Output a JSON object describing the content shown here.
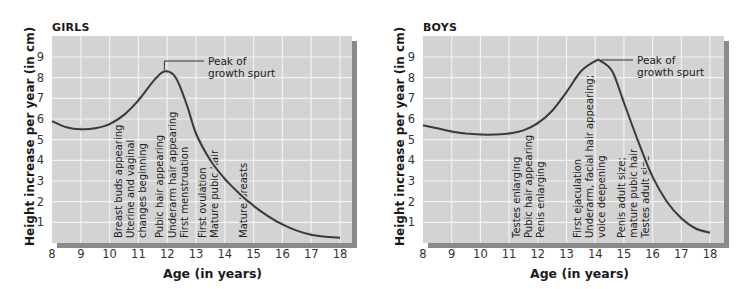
{
  "chart_data": [
    {
      "type": "line",
      "title": "GIRLS",
      "xlabel": "Age (in years)",
      "ylabel": "Height increase per year (in cm)",
      "xlim": [
        8,
        18
      ],
      "ylim": [
        0,
        9.9
      ],
      "x_ticks": [
        8,
        9,
        10,
        11,
        12,
        13,
        14,
        15,
        16,
        17,
        18
      ],
      "y_ticks": [
        1,
        2,
        3,
        4,
        5,
        6,
        7,
        8,
        9
      ],
      "grid": true,
      "series": [
        {
          "name": "Girls height increase",
          "x": [
            8,
            8.5,
            9,
            9.5,
            10,
            10.5,
            11,
            11.5,
            11.9,
            12.3,
            12.7,
            13,
            13.5,
            14,
            14.5,
            15,
            15.5,
            16,
            16.5,
            17,
            17.5,
            18
          ],
          "values": [
            5.9,
            5.6,
            5.5,
            5.55,
            5.75,
            6.2,
            6.9,
            7.8,
            8.3,
            8.0,
            6.6,
            5.3,
            4.0,
            3.1,
            2.4,
            1.8,
            1.3,
            0.9,
            0.6,
            0.4,
            0.3,
            0.25
          ]
        }
      ],
      "annotations": [
        {
          "text": "Peak of growth spurt",
          "x": 11.9,
          "y": 8.3
        },
        {
          "text": "Breast buds appearing",
          "x": 10.3
        },
        {
          "text": "Uterine and vaginal changes beginning",
          "x": 10.7
        },
        {
          "text": "Pubic hair appearing",
          "x": 11.6
        },
        {
          "text": "Underarm hair appearing",
          "x": 12.1
        },
        {
          "text": "First menstruation",
          "x": 12.5
        },
        {
          "text": "First ovulation",
          "x": 13.1
        },
        {
          "text": "Mature pubic hair",
          "x": 13.5
        },
        {
          "text": "Mature breasts",
          "x": 14.6
        }
      ]
    },
    {
      "type": "line",
      "title": "BOYS",
      "xlabel": "Age (in years)",
      "ylabel": "Height increase per year (in cm)",
      "xlim": [
        8,
        18
      ],
      "ylim": [
        0,
        9.9
      ],
      "x_ticks": [
        8,
        9,
        10,
        11,
        12,
        13,
        14,
        15,
        16,
        17,
        18
      ],
      "y_ticks": [
        1,
        2,
        3,
        4,
        5,
        6,
        7,
        8,
        9
      ],
      "grid": true,
      "series": [
        {
          "name": "Boys height increase",
          "x": [
            8,
            8.5,
            9,
            9.5,
            10,
            10.5,
            11,
            11.5,
            12,
            12.5,
            13,
            13.5,
            14,
            14.2,
            14.6,
            15,
            15.5,
            16,
            16.5,
            17,
            17.5,
            18
          ],
          "values": [
            5.7,
            5.55,
            5.4,
            5.3,
            5.25,
            5.25,
            5.3,
            5.45,
            5.8,
            6.4,
            7.3,
            8.3,
            8.8,
            8.8,
            8.3,
            6.8,
            4.9,
            3.2,
            2.0,
            1.2,
            0.7,
            0.5
          ]
        }
      ],
      "annotations": [
        {
          "text": "Peak of growth spurt",
          "x": 14.2,
          "y": 8.8
        },
        {
          "text": "Testes enlarging",
          "x": 11.3
        },
        {
          "text": "Pubic hair appearing",
          "x": 11.7
        },
        {
          "text": "Penis enlarging",
          "x": 12.1
        },
        {
          "text": "First ejaculation",
          "x": 13.2
        },
        {
          "text": "Underarm, facial hair appearing; voice deepening",
          "x": 13.6
        },
        {
          "text": "Penis adult size; mature pubic hair",
          "x": 14.8
        },
        {
          "text": "Testes adult size",
          "x": 15.6
        }
      ]
    }
  ],
  "girls": {
    "title": "GIRLS",
    "ylabel": "Height increase per year (in cm)",
    "xlabel": "Age (in years)",
    "peak_label_1": "Peak of",
    "peak_label_2": "growth spurt",
    "events": [
      "Breast buds appearing",
      "Uterine and vaginal",
      "changes beginning",
      "Pubic hair appearing",
      "Underarm hair appearing",
      "First menstruation",
      "First ovulation",
      "Mature pubic hair",
      "Mature breasts"
    ]
  },
  "boys": {
    "title": "BOYS",
    "ylabel": "Height increase per year (in cm)",
    "xlabel": "Age (in years)",
    "peak_label_1": "Peak of",
    "peak_label_2": "growth spurt",
    "events": [
      "Testes enlarging",
      "Pubic hair appearing",
      "Penis enlarging",
      "First ejaculation",
      "Underarm, facial hair appearing;",
      "voice deepening",
      "Penis adult size;",
      "mature pubic hair",
      "Testes adult size"
    ]
  },
  "x_tick_labels": [
    "8",
    "9",
    "10",
    "11",
    "12",
    "13",
    "14",
    "15",
    "16",
    "17",
    "18"
  ],
  "y_tick_labels": [
    "1",
    "2",
    "3",
    "4",
    "5",
    "6",
    "7",
    "8",
    "9"
  ],
  "colors": {
    "plot_bg": "#d3d3d3",
    "grid": "#f2f2f2",
    "curve": "#3a3a3a",
    "shadow": "#8a8a8a",
    "text": "#1a1a1a"
  }
}
